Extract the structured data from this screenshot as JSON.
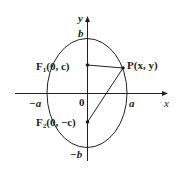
{
  "figure": {
    "axes": {
      "x_label": "x",
      "y_label": "y",
      "origin_label": "0"
    },
    "vertex_labels": {
      "pos_a": "a",
      "neg_a": "−a",
      "pos_b": "b",
      "neg_b": "−b"
    },
    "points": {
      "F1": {
        "name": "F",
        "subscript": "1",
        "coords": "(0, c)"
      },
      "F2": {
        "name": "F",
        "subscript": "2",
        "coords": "(0, −c)"
      },
      "P": {
        "name": "P",
        "coords": "(x, y)"
      }
    },
    "colors": {
      "ink": "#231f20",
      "background": "#ffffff"
    }
  }
}
